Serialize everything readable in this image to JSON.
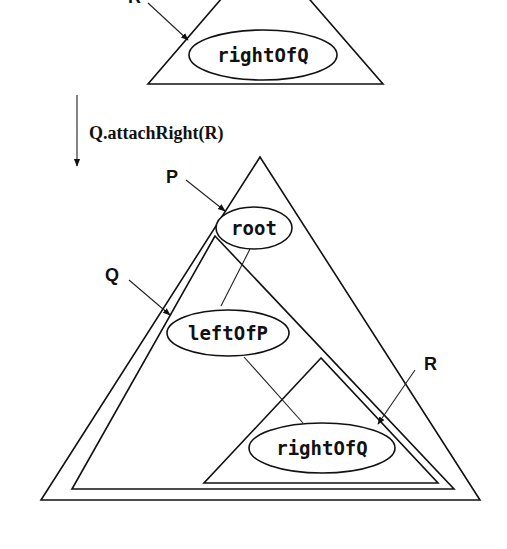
{
  "diagram": {
    "before": {
      "pointer_label": "R",
      "node_label": "rightOfQ"
    },
    "operation": {
      "label": "Q.attachRight(R)"
    },
    "after": {
      "pointers": [
        {
          "label": "P",
          "target": "root"
        },
        {
          "label": "Q",
          "target": "leftOfP"
        },
        {
          "label": "R",
          "target": "rightOfQ"
        }
      ],
      "nodes": [
        {
          "label": "root"
        },
        {
          "label": "leftOfP"
        },
        {
          "label": "rightOfQ"
        }
      ]
    },
    "colors": {
      "ink": "#111111",
      "background": "#ffffff"
    }
  }
}
